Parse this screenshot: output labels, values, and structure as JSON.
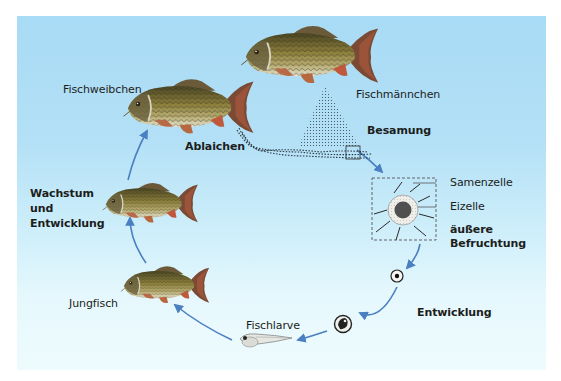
{
  "diagram": {
    "colors": {
      "background_top": "#a8dbf5",
      "background_bottom": "#eefbfd",
      "arrow": "#4a7fc1",
      "text": "#1d1d1b",
      "fish_body": "#8a7a3a",
      "fish_fin": "#c0664a"
    },
    "labels": {
      "fischweibchen": "Fischweibchen",
      "fischmaennchen": "Fischmännchen",
      "ablaichen": "Ablaichen",
      "besamung": "Besamung",
      "samenzelle": "Samenzelle",
      "eizelle": "Eizelle",
      "aeussere_befruchtung_1": "äußere",
      "aeussere_befruchtung_2": "Befruchtung",
      "entwicklung": "Entwicklung",
      "fischlarve": "Fischlarve",
      "jungfisch": "Jungfisch",
      "wachstum_1": "Wachstum",
      "wachstum_2": "und",
      "wachstum_3": "Entwicklung"
    },
    "stages": [
      {
        "name": "Fischmännchen",
        "icon": "male-carp"
      },
      {
        "name": "Besamung",
        "icon": "sperm-cloud"
      },
      {
        "name": "äußere Befruchtung",
        "icon": "fertilized-egg-detail"
      },
      {
        "name": "Entwicklung",
        "icon": "developing-egg"
      },
      {
        "name": "Fischlarve",
        "icon": "fish-larva"
      },
      {
        "name": "Jungfisch",
        "icon": "young-carp"
      },
      {
        "name": "Wachstum und Entwicklung",
        "icon": "growing-carp"
      },
      {
        "name": "Fischweibchen",
        "icon": "female-carp"
      },
      {
        "name": "Ablaichen",
        "icon": "egg-strand"
      }
    ]
  }
}
